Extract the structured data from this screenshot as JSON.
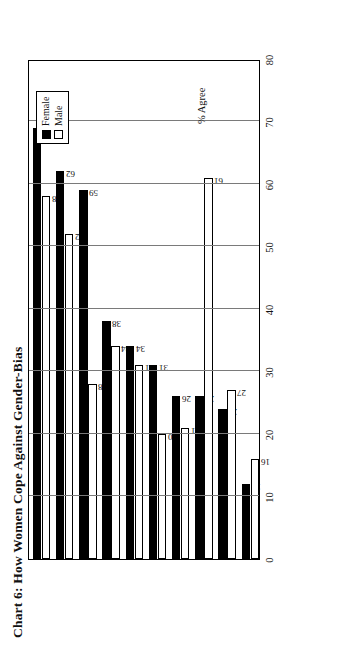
{
  "chart_data": {
    "type": "bar",
    "orientation": "horizontal",
    "title": "Chart 6: How Women Cope Against Gender-Bias",
    "xlabel": "% Agree",
    "ylabel": "",
    "xlim": [
      0,
      80
    ],
    "xticks": [
      "0",
      "10",
      "20",
      "30",
      "40",
      "50",
      "60",
      "70",
      "80"
    ],
    "grid": true,
    "legend_position": "top-right",
    "categories": [
      "Accept slower rate of advancement",
      "Challenge policies individually",
      "Work harder than men",
      "Gender-bias doesn't affect me",
      "Wait and hope their day will come",
      "Remain silent, no point rocking the boat",
      "Change job",
      "Challenge policies through Prof. Orgs.",
      "Challenge policies collectively",
      "Take legal action"
    ],
    "series": [
      {
        "name": "Female",
        "color": "#000000",
        "values": [
          69,
          62,
          59,
          38,
          34,
          31,
          26,
          26,
          24,
          12
        ]
      },
      {
        "name": "Male",
        "color": "#ffffff",
        "values": [
          58,
          52,
          28,
          34,
          31,
          20,
          21,
          61,
          27,
          16
        ]
      }
    ]
  },
  "legend": {
    "items": [
      {
        "label": "Female",
        "swatch": "filled-black-square"
      },
      {
        "label": "Male",
        "swatch": "hollow-white-square"
      }
    ]
  }
}
